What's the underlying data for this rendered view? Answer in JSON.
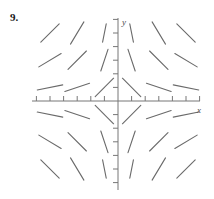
{
  "figure": {
    "problem_number": "9.",
    "axis_labels": {
      "x": "x",
      "y": "y"
    },
    "colors": {
      "axis": "#777777",
      "segment": "#6a6a6a",
      "label": "#4a4a4a",
      "number": "#1a1a1a",
      "background": "#ffffff"
    }
  },
  "chart_data": {
    "type": "scatter",
    "title": "",
    "subtitle": "",
    "xlabel": "x",
    "ylabel": "y",
    "annotations": [
      "9."
    ],
    "legend": [],
    "legend_position": "none",
    "grid": false,
    "xlim": [
      -6.6,
      6.6
    ],
    "ylim": [
      -6.6,
      6.6
    ],
    "xticks": [
      -6,
      -5,
      -4,
      -3,
      -2,
      -1,
      1,
      2,
      3,
      4,
      5,
      6
    ],
    "yticks": [
      -6,
      -5,
      -4,
      -3,
      -2,
      -1,
      1,
      2,
      3,
      4,
      5,
      6
    ],
    "xtick_labels": [
      "",
      "",
      "",
      "",
      "",
      "",
      "",
      "",
      "",
      "",
      "",
      ""
    ],
    "ytick_labels": [
      "",
      "",
      "",
      "",
      "",
      "",
      "",
      "",
      "",
      "",
      "",
      ""
    ],
    "equation": "dy/dx = -y/x",
    "origin_px": {
      "x": 118,
      "y": 101
    },
    "units_per_px": 0.0714,
    "segment_length_px": 26,
    "segments": [
      {
        "x": -5,
        "y": 5,
        "slope": 1.0,
        "quadrant": 2
      },
      {
        "x": -3,
        "y": 5,
        "slope": 1.667,
        "quadrant": 2
      },
      {
        "x": -1,
        "y": 5,
        "slope": 5.0,
        "quadrant": 2
      },
      {
        "x": -5,
        "y": 3,
        "slope": 0.6,
        "quadrant": 2
      },
      {
        "x": -3,
        "y": 3,
        "slope": 1.0,
        "quadrant": 2
      },
      {
        "x": -1,
        "y": 3,
        "slope": 3.0,
        "quadrant": 2
      },
      {
        "x": -5,
        "y": 1,
        "slope": 0.2,
        "quadrant": 2
      },
      {
        "x": -3,
        "y": 1,
        "slope": 0.333,
        "quadrant": 2
      },
      {
        "x": -1,
        "y": 1,
        "slope": 1.0,
        "quadrant": 2
      },
      {
        "x": 1,
        "y": 5,
        "slope": -5.0,
        "quadrant": 1
      },
      {
        "x": 3,
        "y": 5,
        "slope": -1.667,
        "quadrant": 1
      },
      {
        "x": 5,
        "y": 5,
        "slope": -1.0,
        "quadrant": 1
      },
      {
        "x": 1,
        "y": 3,
        "slope": -3.0,
        "quadrant": 1
      },
      {
        "x": 3,
        "y": 3,
        "slope": -1.0,
        "quadrant": 1
      },
      {
        "x": 5,
        "y": 3,
        "slope": -0.6,
        "quadrant": 1
      },
      {
        "x": 1,
        "y": 1,
        "slope": -1.0,
        "quadrant": 1
      },
      {
        "x": 3,
        "y": 1,
        "slope": -0.333,
        "quadrant": 1
      },
      {
        "x": 5,
        "y": 1,
        "slope": -0.2,
        "quadrant": 1
      },
      {
        "x": -5,
        "y": -1,
        "slope": -0.2,
        "quadrant": 3
      },
      {
        "x": -3,
        "y": -1,
        "slope": -0.333,
        "quadrant": 3
      },
      {
        "x": -1,
        "y": -1,
        "slope": -1.0,
        "quadrant": 3
      },
      {
        "x": -5,
        "y": -3,
        "slope": -0.6,
        "quadrant": 3
      },
      {
        "x": -3,
        "y": -3,
        "slope": -1.0,
        "quadrant": 3
      },
      {
        "x": -1,
        "y": -3,
        "slope": -3.0,
        "quadrant": 3
      },
      {
        "x": -5,
        "y": -5,
        "slope": -1.0,
        "quadrant": 3
      },
      {
        "x": -3,
        "y": -5,
        "slope": -1.667,
        "quadrant": 3
      },
      {
        "x": -1,
        "y": -5,
        "slope": -5.0,
        "quadrant": 3
      },
      {
        "x": 1,
        "y": -1,
        "slope": 1.0,
        "quadrant": 4
      },
      {
        "x": 3,
        "y": -1,
        "slope": 0.333,
        "quadrant": 4
      },
      {
        "x": 5,
        "y": -1,
        "slope": 0.2,
        "quadrant": 4
      },
      {
        "x": 1,
        "y": -3,
        "slope": 3.0,
        "quadrant": 4
      },
      {
        "x": 3,
        "y": -3,
        "slope": 1.0,
        "quadrant": 4
      },
      {
        "x": 5,
        "y": -3,
        "slope": 0.6,
        "quadrant": 4
      },
      {
        "x": 1,
        "y": -5,
        "slope": 5.0,
        "quadrant": 4
      },
      {
        "x": 3,
        "y": -5,
        "slope": 1.667,
        "quadrant": 4
      },
      {
        "x": 5,
        "y": -5,
        "slope": 1.0,
        "quadrant": 4
      }
    ]
  }
}
